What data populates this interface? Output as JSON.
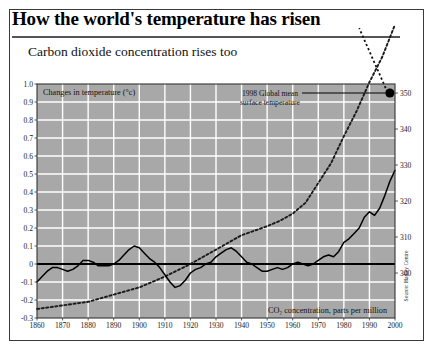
{
  "header": {
    "title": "How the world's temperature has risen",
    "subtitle": "Carbon dioxide concentration rises too"
  },
  "annotations": {
    "temp_box_label": "Changes in temperature (°c)",
    "co2_box_label": "CO₂  concentration, parts per million",
    "callout_line1": "1998 Global mean",
    "callout_line2": "surface temperature",
    "source": "Source: Hadley Centre"
  },
  "colors": {
    "plot_background": "#a8a8a8",
    "gridline": "#ffffff",
    "temperature_line": "#000000",
    "co2_line": "#1a1a1a",
    "frame": "#3a3a3a",
    "marker": "#000000"
  },
  "chart_data": {
    "type": "line",
    "title": "How the world's temperature has risen",
    "subtitle": "Carbon dioxide concentration rises too",
    "xlabel": "",
    "ylabel": "Changes in temperature (°c)",
    "y2label": "CO₂ concentration, parts per million",
    "xlim": [
      1860,
      2000
    ],
    "ylim": [
      -0.3,
      1.0
    ],
    "y2lim": [
      287.5,
      352.5
    ],
    "grid": true,
    "legend": "none",
    "xticks": [
      1860,
      1870,
      1880,
      1890,
      1900,
      1910,
      1920,
      1930,
      1940,
      1950,
      1960,
      1970,
      1980,
      1990,
      2000
    ],
    "yticks": [
      -0.3,
      -0.2,
      -0.1,
      0,
      0.1,
      0.2,
      0.3,
      0.4,
      0.5,
      0.6,
      0.7,
      0.8,
      0.9,
      1.0
    ],
    "yticklabels": [
      "-0.3",
      "-0.2",
      "-0.1",
      "0",
      "0.1",
      "0.2",
      "0.3",
      "0.4",
      "0.5",
      "0.6",
      "0.7",
      "0.8",
      "0.9",
      "1.0"
    ],
    "y2ticks": [
      300,
      310,
      320,
      330,
      340,
      350
    ],
    "y2ticklabels": [
      "300",
      "310",
      "320",
      "330",
      "340",
      "350"
    ],
    "series": [
      {
        "name": "Global mean surface temperature anomaly",
        "axis": "left",
        "style": "solid",
        "x": [
          1860,
          1862,
          1864,
          1866,
          1868,
          1870,
          1872,
          1874,
          1876,
          1878,
          1880,
          1882,
          1884,
          1886,
          1888,
          1890,
          1892,
          1894,
          1896,
          1898,
          1900,
          1902,
          1904,
          1906,
          1908,
          1910,
          1912,
          1914,
          1916,
          1918,
          1920,
          1922,
          1924,
          1926,
          1928,
          1930,
          1932,
          1934,
          1936,
          1938,
          1940,
          1942,
          1944,
          1946,
          1948,
          1950,
          1952,
          1954,
          1956,
          1958,
          1960,
          1962,
          1964,
          1966,
          1968,
          1970,
          1972,
          1974,
          1976,
          1978,
          1980,
          1982,
          1984,
          1986,
          1988,
          1990,
          1992,
          1994,
          1996,
          1998,
          2000
        ],
        "y": [
          -0.1,
          -0.07,
          -0.04,
          -0.02,
          -0.02,
          -0.03,
          -0.04,
          -0.03,
          -0.01,
          0.02,
          0.02,
          0.01,
          -0.01,
          -0.01,
          -0.01,
          0.0,
          0.02,
          0.05,
          0.08,
          0.1,
          0.09,
          0.06,
          0.03,
          0.01,
          -0.02,
          -0.06,
          -0.1,
          -0.13,
          -0.12,
          -0.09,
          -0.05,
          -0.03,
          -0.02,
          0.0,
          0.01,
          0.04,
          0.06,
          0.08,
          0.09,
          0.07,
          0.04,
          0.01,
          0.0,
          -0.02,
          -0.04,
          -0.04,
          -0.03,
          -0.02,
          -0.03,
          -0.02,
          0.0,
          0.01,
          0.0,
          -0.01,
          0.0,
          0.02,
          0.04,
          0.05,
          0.04,
          0.07,
          0.12,
          0.14,
          0.17,
          0.2,
          0.26,
          0.29,
          0.27,
          0.31,
          0.38,
          0.46,
          0.52
        ]
      },
      {
        "name": "CO2 concentration",
        "axis": "right",
        "style": "dotted",
        "x": [
          1860,
          1870,
          1880,
          1890,
          1900,
          1910,
          1920,
          1930,
          1940,
          1950,
          1955,
          1960,
          1965,
          1970,
          1975,
          1980,
          1985,
          1990,
          1995,
          2000
        ],
        "y": [
          290.0,
          291.0,
          292.0,
          294.0,
          296.0,
          299.0,
          302.5,
          306.5,
          310.5,
          313.0,
          314.5,
          316.5,
          319.5,
          325.0,
          330.5,
          338.0,
          345.0,
          353.0,
          360.0,
          369.0
        ]
      }
    ],
    "markers": [
      {
        "name": "1998-global-mean-surface-temperature",
        "x": 1998,
        "y_left": 0.95,
        "label": "1998 Global mean surface temperature"
      }
    ]
  }
}
